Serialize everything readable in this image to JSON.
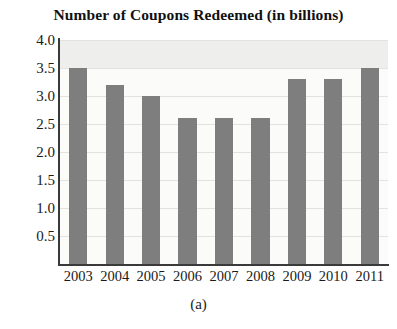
{
  "figure": {
    "caption": "(a)"
  },
  "chart_data": {
    "type": "bar",
    "title": "Number of Coupons Redeemed (in billions)",
    "xlabel": "",
    "ylabel": "",
    "categories": [
      "2003",
      "2004",
      "2005",
      "2006",
      "2007",
      "2008",
      "2009",
      "2010",
      "2011"
    ],
    "values": [
      3.5,
      3.2,
      3.0,
      2.6,
      2.6,
      2.6,
      3.3,
      3.3,
      3.5
    ],
    "ylim": [
      0,
      4.0
    ],
    "ytick_labels": [
      "4.0",
      "3.5",
      "3.0",
      "2.5",
      "2.0",
      "1.5",
      "1.0",
      "0.5"
    ],
    "ytick_values": [
      4.0,
      3.5,
      3.0,
      2.5,
      2.0,
      1.5,
      1.0,
      0.5
    ],
    "grid": true,
    "legend": null,
    "bar_color": "#7e7e7e",
    "plot_background": "#fbfbfa",
    "axis_color": "#3a3a3a"
  }
}
